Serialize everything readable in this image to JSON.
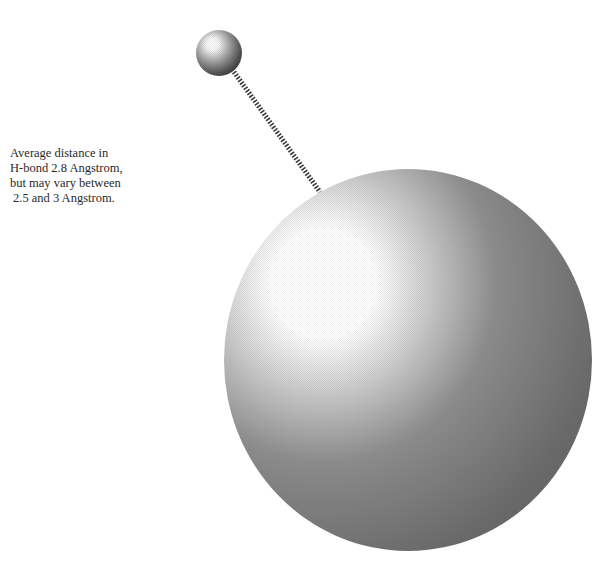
{
  "diagram": {
    "caption": {
      "lines": [
        "Average distance in",
        "H-bond 2.8 Angstrom,",
        "but may vary between",
        "2.5 and 3 Angstrom."
      ]
    },
    "elements": {
      "small_atom": {
        "label": "small atom sphere",
        "center": [
          219,
          53
        ],
        "radius": 23
      },
      "large_atom": {
        "label": "large atom sphere",
        "center": [
          408,
          360
        ],
        "radius_x": 184,
        "radius_y": 191
      },
      "bond": {
        "label": "hydrogen bond (striped line)",
        "from": [
          234,
          72
        ],
        "to": [
          320,
          192
        ]
      }
    },
    "colors": {
      "background": "#ffffff",
      "sphere_highlight": "#ffffff",
      "sphere_shadow": "#6e6e6e",
      "bond": "#3a3a3a",
      "text": "#2a2a2a"
    }
  }
}
